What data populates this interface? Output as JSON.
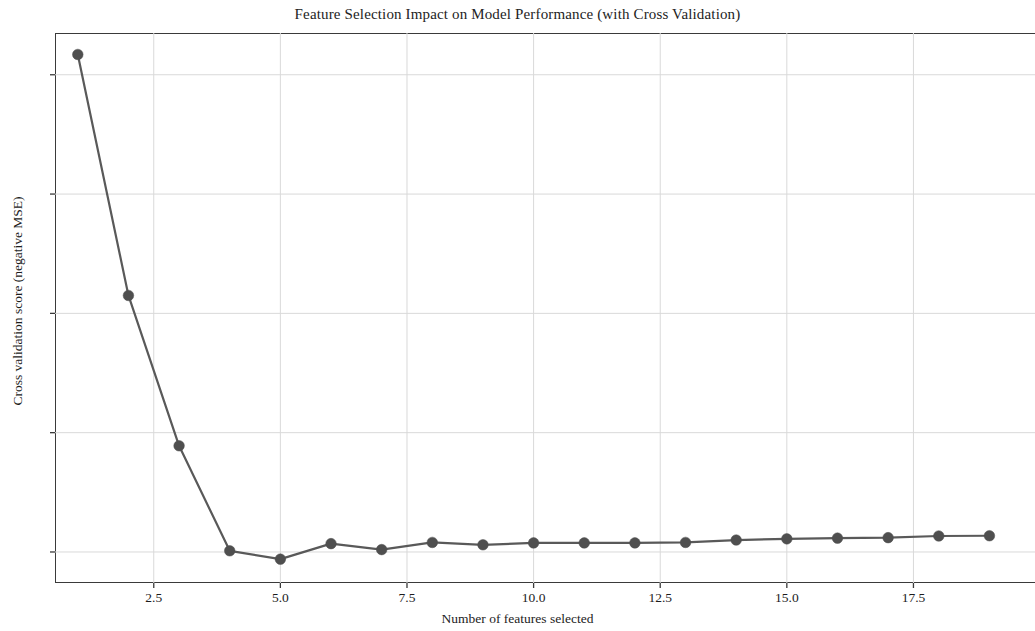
{
  "chart_data": {
    "type": "line",
    "title": "Feature Selection Impact on Model Performance (with Cross Validation)",
    "xlabel": "Number of features selected",
    "ylabel": "Cross validation score (negative MSE)",
    "x": [
      1,
      2,
      3,
      4,
      5,
      6,
      7,
      8,
      9,
      10,
      11,
      12,
      13,
      14,
      15,
      16,
      17,
      18,
      19
    ],
    "values": [
      35.85,
      25.75,
      19.45,
      15.05,
      14.7,
      15.35,
      15.1,
      15.4,
      15.3,
      15.38,
      15.38,
      15.38,
      15.4,
      15.5,
      15.55,
      15.58,
      15.6,
      15.67,
      15.68
    ],
    "series": [
      {
        "name": "Cross validation score",
        "values": [
          35.85,
          25.75,
          19.45,
          15.05,
          14.7,
          15.35,
          15.1,
          15.4,
          15.3,
          15.38,
          15.38,
          15.38,
          15.4,
          15.5,
          15.55,
          15.58,
          15.6,
          15.67,
          15.68
        ]
      }
    ],
    "xticks": [
      2.5,
      5.0,
      7.5,
      10.0,
      12.5,
      15.0,
      17.5
    ],
    "xtick_labels": [
      "2.5",
      "5.0",
      "7.5",
      "10.0",
      "12.5",
      "15.0",
      "17.5"
    ],
    "yticks": [
      15,
      20,
      25,
      30,
      35
    ],
    "ytick_labels": [
      "15",
      "20",
      "25",
      "30",
      "35"
    ],
    "xlim": [
      0.55,
      19.9
    ],
    "ylim": [
      13.7,
      36.75
    ],
    "grid": true,
    "legend": "none",
    "line_color": "#595959",
    "marker_color": "#4f4f4f",
    "marker": "circle",
    "grid_color": "#d9d9d9",
    "axis_color": "#3a3a3a",
    "background": "#ffffff"
  }
}
